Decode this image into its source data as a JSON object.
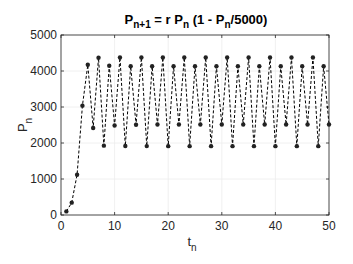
{
  "chart_data": {
    "type": "line",
    "title_parts": {
      "a": "P",
      "a_sub": "n+1",
      "b": " = r P",
      "b_sub": "n",
      "c": " (1 - P",
      "c_sub": "n",
      "d": "/5000)"
    },
    "xlabel": "t",
    "xlabel_sub": "n",
    "ylabel": "P",
    "ylabel_sub": "n",
    "xlim": [
      0,
      50
    ],
    "ylim": [
      0,
      5000
    ],
    "xticks": [
      0,
      10,
      20,
      30,
      40,
      50
    ],
    "yticks": [
      0,
      1000,
      2000,
      3000,
      4000,
      5000
    ],
    "grid": true,
    "legend": null,
    "series": [
      {
        "name": "P_n",
        "style": "dashed line with dot markers",
        "color": "#000000",
        "x": [
          1,
          2,
          3,
          4,
          5,
          6,
          7,
          8,
          9,
          10,
          11,
          12,
          13,
          14,
          15,
          16,
          17,
          18,
          19,
          20,
          21,
          22,
          23,
          24,
          25,
          26,
          27,
          28,
          29,
          30,
          31,
          32,
          33,
          34,
          35,
          36,
          37,
          38,
          39,
          40,
          41,
          42,
          43,
          44,
          45,
          46,
          47,
          48,
          49,
          50
        ],
        "values": [
          100,
          343,
          1118,
          3038,
          4172,
          2418,
          4370,
          1926,
          4146,
          2485,
          4375,
          1915,
          4133,
          2507,
          4375,
          1914,
          4131,
          2512,
          4375,
          1913,
          4131,
          2512,
          4375,
          1913,
          4131,
          2512,
          4375,
          1913,
          4131,
          2512,
          4375,
          1913,
          4131,
          2512,
          4375,
          1913,
          4131,
          2512,
          4375,
          1913,
          4131,
          2512,
          4375,
          1913,
          4131,
          2512,
          4375,
          1913,
          4131,
          2512
        ]
      }
    ]
  },
  "layout": {
    "plot_left": 61,
    "plot_right": 329,
    "plot_top": 35,
    "plot_bottom": 215
  }
}
